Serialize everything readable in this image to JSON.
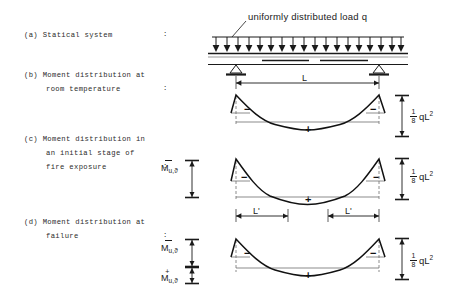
{
  "figure": {
    "type": "engineering-diagram",
    "load_annotation": "uniformly distributed load q",
    "rows": [
      {
        "key": "a",
        "lines": [
          "(a) Statical system",
          ""
        ],
        "colon": ":"
      },
      {
        "key": "b",
        "lines": [
          "(b) Moment distribution at",
          "room temperature"
        ],
        "colon": ":"
      },
      {
        "key": "c",
        "lines": [
          "(c) Moment distribution in",
          "an initial stage of",
          "fire exposure"
        ],
        "colon": ":"
      },
      {
        "key": "d",
        "lines": [
          "(d) Moment distribution at",
          "failure"
        ],
        "colon": ":"
      }
    ],
    "dimensions": {
      "span": "L",
      "hinge_span_left": "L'",
      "hinge_span_right": "L'"
    },
    "right_labels": [
      {
        "numerator": "1",
        "denominator": "8",
        "expr": "qL",
        "exponent": "2"
      },
      {
        "numerator": "1",
        "denominator": "8",
        "expr": "qL",
        "exponent": "2"
      },
      {
        "numerator": "1",
        "denominator": "8",
        "expr": "qL",
        "exponent": "2"
      }
    ],
    "moment_symbols": [
      {
        "id": "c-negative",
        "base": "M",
        "sub": "u,ϑ",
        "accent": "bar"
      },
      {
        "id": "d-negative",
        "base": "M",
        "sub": "u,ϑ",
        "accent": "bar"
      },
      {
        "id": "d-positive",
        "base": "M",
        "sub": "u,ϑ",
        "accent": "plus"
      }
    ],
    "sign_markers": {
      "negative": "−",
      "positive": "+"
    },
    "diagram_b": {
      "negative_left": "−",
      "negative_right": "−",
      "positive_mid": "+"
    },
    "diagram_c": {
      "negative_left": "−",
      "negative_right": "−",
      "positive_mid": "+"
    },
    "diagram_d": {
      "negative_left": "−",
      "negative_right": "−",
      "positive_mid": "+"
    },
    "load_arrow_count": 18,
    "colors": {
      "ink": "#1a1a1a",
      "gray_beam": "#8c8c8c",
      "paper": "#ffffff"
    }
  }
}
